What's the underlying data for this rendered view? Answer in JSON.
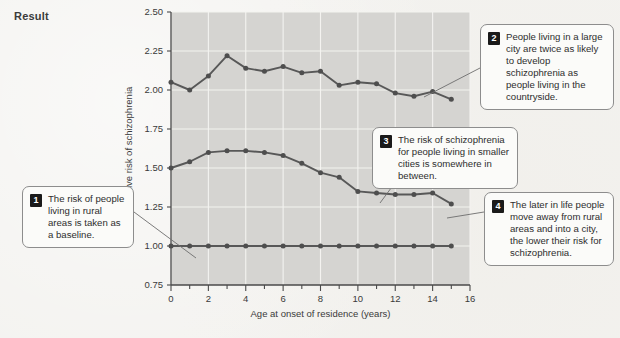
{
  "page": {
    "section_label": "Result",
    "background_color": "#f3f2ef",
    "plot_background_color": "#d5d4d1"
  },
  "chart_data": {
    "type": "line",
    "title": "",
    "xlabel": "Age at onset of residence (years)",
    "ylabel": "Relative risk of schizophrenia",
    "xlim": [
      0,
      16
    ],
    "ylim": [
      0.75,
      2.5
    ],
    "xticks": [
      0,
      2,
      4,
      6,
      8,
      10,
      12,
      14,
      16
    ],
    "xtick_labels": [
      "0",
      "2",
      "4",
      "6",
      "8",
      "10",
      "12",
      "14",
      "16"
    ],
    "yticks": [
      0.75,
      1.0,
      1.25,
      1.5,
      1.75,
      2.0,
      2.25,
      2.5
    ],
    "ytick_labels": [
      "0.75",
      "1.00",
      "1.25",
      "1.50",
      "1.75",
      "2.00",
      "2.25",
      "2.50"
    ],
    "grid": true,
    "legend": "none",
    "x": [
      0,
      1,
      2,
      3,
      4,
      5,
      6,
      7,
      8,
      9,
      10,
      11,
      12,
      13,
      14,
      15
    ],
    "series": [
      {
        "name": "Capital / large city",
        "color": "#4e4e4e",
        "values": [
          2.05,
          2.0,
          2.09,
          2.22,
          2.14,
          2.12,
          2.15,
          2.11,
          2.12,
          2.03,
          2.05,
          2.04,
          1.98,
          1.96,
          1.99,
          1.94
        ]
      },
      {
        "name": "Smaller cities / suburb",
        "color": "#6a6a6a",
        "values": [
          1.5,
          1.54,
          1.6,
          1.61,
          1.61,
          1.6,
          1.58,
          1.53,
          1.47,
          1.44,
          1.35,
          1.34,
          1.33,
          1.33,
          1.34,
          1.27
        ]
      },
      {
        "name": "Rural area (baseline)",
        "color": "#4e4e4e",
        "values": [
          1.0,
          1.0,
          1.0,
          1.0,
          1.0,
          1.0,
          1.0,
          1.0,
          1.0,
          1.0,
          1.0,
          1.0,
          1.0,
          1.0,
          1.0,
          1.0
        ]
      }
    ]
  },
  "callouts": [
    {
      "number": "1",
      "text": "The risk of people living in rural areas is taken as a baseline."
    },
    {
      "number": "2",
      "text": "People living in a large city are twice as likely to develop schizophrenia as people living in the countryside."
    },
    {
      "number": "3",
      "text": "The risk of schizophrenia for people living in smaller cities is somewhere in between."
    },
    {
      "number": "4",
      "text": "The later in life people move away from rural areas and into a city, the lower their risk for schizophrenia."
    }
  ]
}
